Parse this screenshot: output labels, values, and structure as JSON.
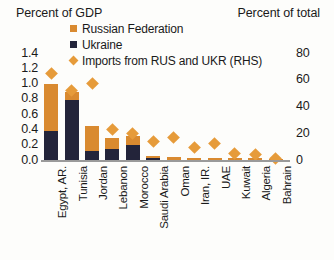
{
  "axes": {
    "left_title": "Percent of GDP",
    "right_title": "Percent of total"
  },
  "legend": {
    "items": [
      {
        "label": "Russian Federation",
        "marker": "square-swatch-icon",
        "color": "#D98A30"
      },
      {
        "label": "Ukraine",
        "marker": "square-swatch-icon",
        "color": "#23243A"
      },
      {
        "label": "Imports from RUS and UKR (RHS)",
        "marker": "diamond-swatch-icon",
        "color": "#E69B3A"
      }
    ]
  },
  "colors": {
    "russia": "#D98A30",
    "ukraine": "#23243A",
    "diamond": "#E69B3A",
    "axis": "#9a9a9a",
    "text": "#1a1a1a"
  },
  "chart_data": {
    "type": "bar",
    "title": "",
    "subtitle": "",
    "xlabel": "",
    "ylabel": "Percent of GDP",
    "y2label": "Percent of total",
    "ylim": [
      0,
      1.4
    ],
    "y2lim": [
      0,
      80
    ],
    "yticks": [
      "1.4",
      "1.2",
      "1.0",
      "0.8",
      "0.6",
      "0.4",
      "0.2",
      "0.0"
    ],
    "ytick_values": [
      1.4,
      1.2,
      1.0,
      0.8,
      0.6,
      0.4,
      0.2,
      0.0
    ],
    "y2ticks": [
      "80",
      "60",
      "40",
      "20",
      "0"
    ],
    "y2tick_values": [
      80,
      60,
      40,
      20,
      0
    ],
    "grid": false,
    "legend_position": "top-center",
    "stacked": true,
    "categories": [
      "Egypt, AR.",
      "Tunisia",
      "Jordan",
      "Lebanon",
      "Morocco",
      "Saudi Arabia",
      "Oman",
      "Iran, IR.",
      "UAE",
      "Kuwait",
      "Algeria",
      "Bahrain"
    ],
    "series": [
      {
        "name": "Russian Federation",
        "axis": "left",
        "color": "#D98A30",
        "values": [
          0.62,
          0.1,
          0.32,
          0.15,
          0.12,
          0.02,
          0.04,
          0.03,
          0.02,
          0.03,
          0.02,
          0.01
        ]
      },
      {
        "name": "Ukraine",
        "axis": "left",
        "color": "#23243A",
        "values": [
          0.38,
          0.79,
          0.12,
          0.14,
          0.2,
          0.03,
          0.0,
          0.0,
          0.0,
          0.0,
          0.0,
          0.0
        ]
      },
      {
        "name": "Imports from RUS and UKR (RHS)",
        "axis": "right",
        "type": "scatter",
        "marker": "diamond",
        "color": "#E69B3A",
        "values": [
          65,
          52,
          57,
          23,
          20,
          14,
          17,
          9,
          12,
          5,
          4,
          1
        ]
      }
    ]
  }
}
